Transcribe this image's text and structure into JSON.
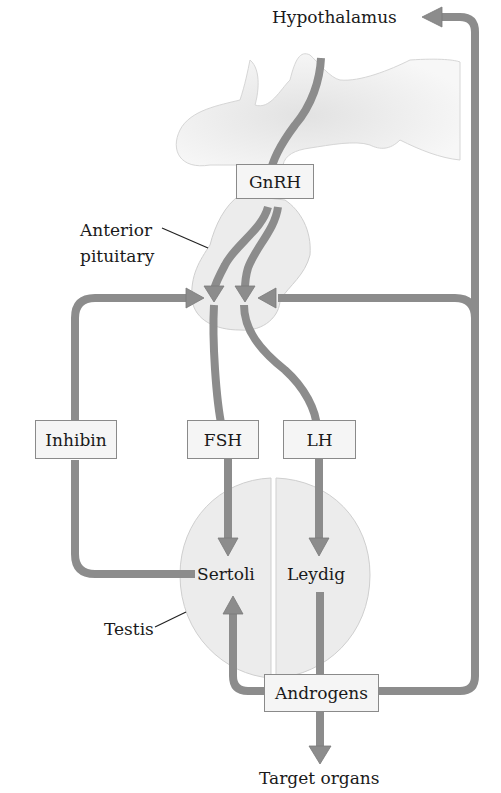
{
  "diagram": {
    "labels": {
      "hypothalamus": "Hypothalamus",
      "anterior_pituitary_line1": "Anterior",
      "anterior_pituitary_line2": "pituitary",
      "sertoli": "Sertoli",
      "leydig": "Leydig",
      "testis": "Testis",
      "target_organs": "Target organs"
    },
    "boxes": {
      "gnrh": "GnRH",
      "inhibin": "Inhibin",
      "fsh": "FSH",
      "lh": "LH",
      "androgens": "Androgens"
    },
    "colors": {
      "arrow": "#8c8c8c",
      "arrow_edge": "#6e6e6e",
      "tissue_fill": "#ececec",
      "tissue_edge": "#cfcfcf",
      "box_fill": "#f5f5f5",
      "box_border": "#8a8a8a",
      "text": "#1a1a1a"
    },
    "relationships": [
      {
        "from": "Hypothalamus",
        "to": "Anterior pituitary",
        "via": "GnRH"
      },
      {
        "from": "Anterior pituitary",
        "to": "Sertoli",
        "via": "FSH"
      },
      {
        "from": "Anterior pituitary",
        "to": "Leydig",
        "via": "LH"
      },
      {
        "from": "Sertoli",
        "to": "Anterior pituitary",
        "via": "Inhibin",
        "type": "feedback"
      },
      {
        "from": "Leydig",
        "to": "Sertoli",
        "via": "Androgens"
      },
      {
        "from": "Leydig",
        "to": "Target organs",
        "via": "Androgens"
      },
      {
        "from": "Leydig",
        "to": "Anterior pituitary",
        "via": "Androgens",
        "type": "feedback"
      },
      {
        "from": "Leydig",
        "to": "Hypothalamus",
        "via": "Androgens",
        "type": "feedback"
      }
    ]
  }
}
